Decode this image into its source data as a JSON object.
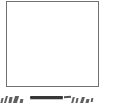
{
  "document": {
    "kind": "scanned-figure-fragment",
    "page_background": "#ffffff",
    "width_px": 116,
    "height_px": 109
  },
  "figure": {
    "name": "empty-framed-box",
    "border_color": "#6f6f6f",
    "fill_color": "#ffffff",
    "border_width_px": 1,
    "left_px": 6,
    "top_px": 1,
    "width_px": 93,
    "height_px": 86,
    "interior_text": "",
    "interior_state": "blank"
  },
  "caption": {
    "name": "clipped-caption-strip",
    "visible_text": "",
    "legibility": "illegible",
    "ink_color": "#3d3d3d",
    "rule": {
      "name": "horizontal-rule-bar",
      "color": "#2c2c2c",
      "left_px": 30,
      "top_px": 96,
      "width_px": 33,
      "height_px": 3
    },
    "marks": [
      {
        "id": "mark-left-a",
        "group": "left"
      },
      {
        "id": "mark-left-b",
        "group": "left"
      },
      {
        "id": "mark-left-c",
        "group": "left"
      },
      {
        "id": "mark-left-d",
        "group": "left"
      },
      {
        "id": "mark-left-e",
        "group": "left"
      },
      {
        "id": "mark-dash-right",
        "group": "rule"
      },
      {
        "id": "mark-right-a",
        "group": "right"
      },
      {
        "id": "mark-right-b",
        "group": "right"
      },
      {
        "id": "mark-right-c",
        "group": "right"
      },
      {
        "id": "mark-right-d",
        "group": "right"
      },
      {
        "id": "mark-right-e",
        "group": "right"
      }
    ]
  }
}
